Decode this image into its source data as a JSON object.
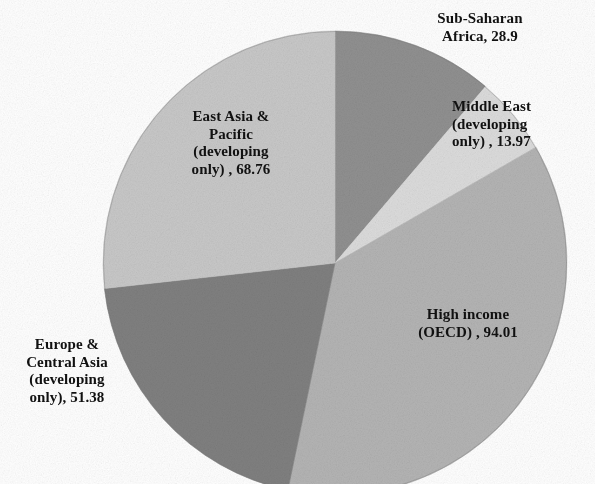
{
  "figure": {
    "background_color": "#ffffff",
    "width": 595,
    "height": 484
  },
  "chart_data": {
    "type": "pie",
    "title": "",
    "subtitle": "",
    "xlabel": "",
    "ylabel": "",
    "legend_position": "none",
    "grid": false,
    "labels_on_slices": true,
    "start_angle_deg": 0,
    "direction": "clockwise",
    "total": 257.02,
    "categories": [
      "Sub-Saharan Africa",
      "Middle East (developing only)",
      "High income (OECD)",
      "Europe & Central Asia (developing only)",
      "East Asia & Pacific (developing only)"
    ],
    "values": [
      28.9,
      13.97,
      94.01,
      51.38,
      68.76
    ],
    "colors": [
      "#909090",
      "#dcdcdc",
      "#b4b4b4",
      "#808080",
      "#c8c8c8"
    ],
    "slices": [
      {
        "name": "Sub-Saharan Africa",
        "value": 28.9,
        "value_text": "28.9",
        "label_text": "Sub-Saharan\nAfrica, 28.9",
        "color": "#909090",
        "percent": 11.24,
        "start_angle_deg": 0,
        "end_angle_deg": 40.48
      },
      {
        "name": "Middle East (developing only)",
        "value": 13.97,
        "value_text": "13.97",
        "label_text": "Middle East\n(developing\nonly) , 13.97",
        "color": "#dcdcdc",
        "percent": 5.44,
        "start_angle_deg": 40.48,
        "end_angle_deg": 60.05
      },
      {
        "name": "High income (OECD)",
        "value": 94.01,
        "value_text": "94.01",
        "label_text": "High income\n(OECD) , 94.01",
        "color": "#b4b4b4",
        "percent": 36.58,
        "start_angle_deg": 60.05,
        "end_angle_deg": 191.7
      },
      {
        "name": "Europe & Central Asia (developing only)",
        "value": 51.38,
        "value_text": "51.38",
        "label_text": "Europe &\nCentral Asia\n(developing\nonly), 51.38",
        "color": "#808080",
        "percent": 19.99,
        "start_angle_deg": 191.7,
        "end_angle_deg": 263.66
      },
      {
        "name": "East Asia & Pacific (developing only)",
        "value": 68.76,
        "value_text": "68.76",
        "label_text": "East Asia &\nPacific\n(developing\nonly) , 68.76",
        "color": "#c8c8c8",
        "percent": 26.75,
        "start_angle_deg": 263.66,
        "end_angle_deg": 360
      }
    ]
  },
  "geometry": {
    "center_x": 335,
    "center_y": 263,
    "radius": 232
  }
}
